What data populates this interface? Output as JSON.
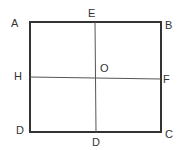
{
  "diagram": {
    "type": "square-with-midlines",
    "colors": {
      "outline": "#333333",
      "midline": "#555555",
      "label": "#333333",
      "background": "#ffffff"
    },
    "labels": {
      "A": "A",
      "B": "B",
      "C": "C",
      "D_corner": "D",
      "E": "E",
      "F": "F",
      "H": "H",
      "O": "O",
      "D_bottom_mid": "D"
    }
  }
}
